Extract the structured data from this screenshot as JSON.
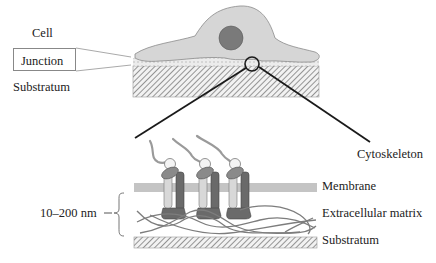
{
  "labels": {
    "cell": "Cell",
    "junction": "Junction",
    "substratum_top": "Substratum",
    "cytoskeleton": "Cytoskeleton",
    "distance": "10–200 nm",
    "membrane": "Membrane",
    "ecm": "Extracellular matrix",
    "substratum_bottom": "Substratum"
  },
  "colors": {
    "cell_fill": "#d6d6d6",
    "nucleus": "#7a7a7a",
    "membrane": "#c4c4c4",
    "integrin_light": "#d0d0d0",
    "integrin_dark": "#6a6a6a",
    "fiber": "#7d7d7d",
    "pointer": "#1a1a1a"
  }
}
